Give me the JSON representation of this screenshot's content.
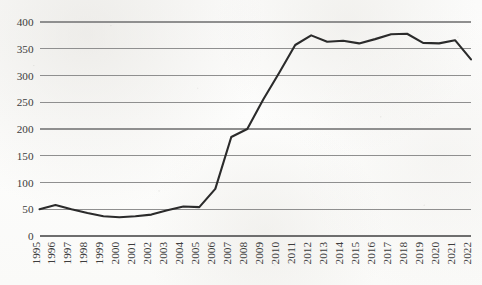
{
  "chart_data": {
    "type": "line",
    "title": "",
    "subtitle": "",
    "xlabel": "",
    "ylabel": "",
    "grid": true,
    "legend": false,
    "legend_position": "none",
    "line_color": "#2b2b2b",
    "gridline_color": "#8f8f8f",
    "background_color": "#fbfbfa",
    "xlim": [
      1995,
      2022
    ],
    "ylim": [
      0,
      400
    ],
    "y_ticks": [
      0,
      50,
      100,
      150,
      200,
      250,
      300,
      350,
      400
    ],
    "y_tick_labels": [
      "0",
      "50",
      "100",
      "150",
      "200",
      "250",
      "300",
      "350",
      "400"
    ],
    "categories": [
      "1995",
      "1996",
      "1997",
      "1998",
      "1999",
      "2000",
      "2001",
      "2002",
      "2003",
      "2004",
      "2005",
      "2006",
      "2007",
      "2008",
      "2009",
      "2010",
      "2011",
      "2012",
      "2013",
      "2014",
      "2015",
      "2016",
      "2017",
      "2018",
      "2019",
      "2020",
      "2021",
      "2022"
    ],
    "x_tick_labels": [
      "1995",
      "1996",
      "1997",
      "1998",
      "1999",
      "2000",
      "2001",
      "2002",
      "2003",
      "2004",
      "2005",
      "2006",
      "2007",
      "2008",
      "2009",
      "2010",
      "2011",
      "2012",
      "2013",
      "2014",
      "2015",
      "2016",
      "2017",
      "2018",
      "2019",
      "2020",
      "2021",
      "2022"
    ],
    "series": [
      {
        "name": "series-1",
        "color": "#2b2b2b",
        "values": [
          50,
          58,
          50,
          43,
          37,
          35,
          37,
          40,
          48,
          55,
          54,
          88,
          185,
          200,
          255,
          305,
          357,
          375,
          363,
          365,
          360,
          368,
          377,
          378,
          361,
          360,
          366,
          330
        ]
      }
    ]
  }
}
